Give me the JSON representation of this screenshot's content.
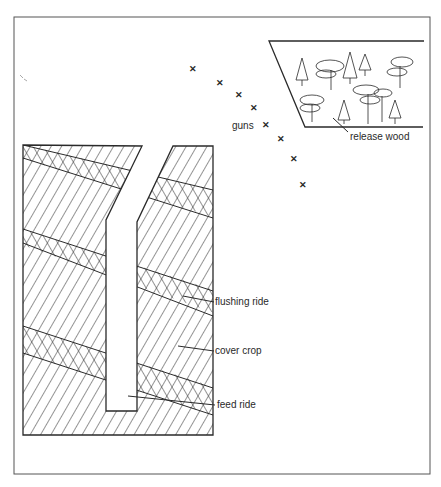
{
  "diagram": {
    "type": "pheasant shoot layout",
    "labels": {
      "release_wood": "release wood",
      "guns": "guns",
      "flushing_ride": "flushing ride",
      "cover_crop": "cover crop",
      "feed_ride": "feed ride"
    },
    "gun_marker": "✕",
    "gun_positions": [
      [
        193,
        70
      ],
      [
        220,
        84
      ],
      [
        239,
        96
      ],
      [
        254,
        109
      ],
      [
        266,
        126
      ],
      [
        281,
        140
      ],
      [
        294,
        160
      ],
      [
        303,
        186
      ]
    ],
    "colors": {
      "ink": "#2a2a2a",
      "frame": "#555555",
      "background": "#ffffff"
    }
  }
}
